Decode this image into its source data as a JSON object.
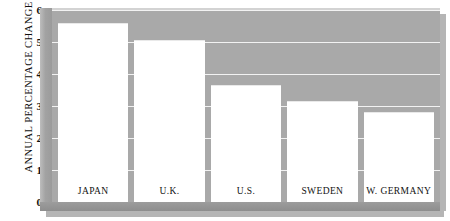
{
  "chart_data": {
    "type": "bar",
    "title": "",
    "xlabel": "",
    "ylabel": "ANNUAL PERCENTAGE CHANGE",
    "categories": [
      "JAPAN",
      "U.K.",
      "U.S.",
      "SWEDEN",
      "W. GERMANY"
    ],
    "values": [
      5.6,
      5.05,
      3.65,
      3.15,
      2.8
    ],
    "ylim": [
      0,
      6
    ],
    "yticks": [
      0,
      1,
      2,
      3,
      4,
      5,
      6
    ],
    "ytick_labels": [
      "0",
      "1",
      "2",
      "3",
      "4",
      "5",
      "6"
    ],
    "grid": true,
    "grid_color": "#f2f2f2",
    "legend": null,
    "bar_color": "#ffffff",
    "plot_background": "#a9a9a9",
    "figure_background": "#ffffff"
  },
  "axis": {
    "y_title": "ANNUAL PERCENTAGE CHANGE",
    "ticks": [
      {
        "label": "6",
        "value": 6
      },
      {
        "label": "5",
        "value": 5
      },
      {
        "label": "4",
        "value": 4
      },
      {
        "label": "3",
        "value": 3
      },
      {
        "label": "2",
        "value": 2
      },
      {
        "label": "1",
        "value": 1
      },
      {
        "label": "0",
        "value": 0
      }
    ]
  },
  "bars": [
    {
      "label": "JAPAN",
      "value": 5.6
    },
    {
      "label": "U.K.",
      "value": 5.05
    },
    {
      "label": "U.S.",
      "value": 3.65
    },
    {
      "label": "SWEDEN",
      "value": 3.15
    },
    {
      "label": "W. GERMANY",
      "value": 2.8
    }
  ]
}
